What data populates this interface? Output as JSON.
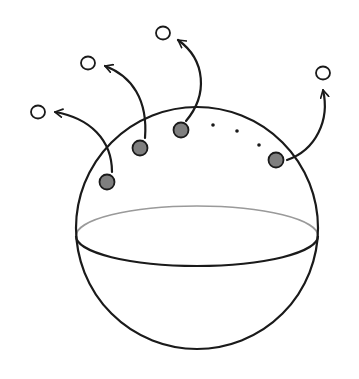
{
  "diagram": {
    "colors": {
      "background": "#ffffff",
      "stroke": "#1a1a1a",
      "equator_back": "#9a9a9a",
      "particle_fill": "#7f7f7f",
      "escaped_fill": "#ffffff"
    },
    "sphere": {
      "cx": 197,
      "cy": 228,
      "r": 121
    },
    "equator": {
      "cx": 197,
      "cy": 236,
      "rx": 121,
      "ry": 30
    },
    "surface_particles": [
      {
        "id": 1,
        "x": 107,
        "y": 182
      },
      {
        "id": 2,
        "x": 140,
        "y": 148
      },
      {
        "id": 3,
        "x": 181,
        "y": 130
      },
      {
        "id": 4,
        "x": 276,
        "y": 160
      }
    ],
    "ellipsis_dots": [
      {
        "x": 213,
        "y": 125
      },
      {
        "x": 237,
        "y": 131
      },
      {
        "x": 259,
        "y": 145
      }
    ],
    "escaped_particles": [
      {
        "id": 1,
        "x": 38,
        "y": 112
      },
      {
        "id": 2,
        "x": 88,
        "y": 63
      },
      {
        "id": 3,
        "x": 163,
        "y": 33
      },
      {
        "id": 4,
        "x": 323,
        "y": 73
      }
    ],
    "arrows": [
      {
        "from": 1,
        "path": "M 112 172 C 112 140, 90 118, 55 112"
      },
      {
        "from": 2,
        "path": "M 145 138 C 148 100, 132 76, 105 66"
      },
      {
        "from": 3,
        "path": "M 186 121 C 208 95, 206 60, 178 40"
      },
      {
        "from": 4,
        "path": "M 287 160 C 316 150, 330 120, 323 90"
      }
    ]
  }
}
